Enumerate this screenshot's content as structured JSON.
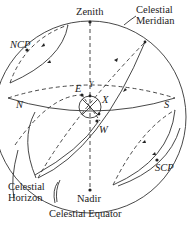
{
  "labels": {
    "zenith": "Zenith",
    "nadir": "Nadir",
    "celestial_meridian_1": "Celestial",
    "celestial_meridian_2": "Meridian",
    "ncp": "NCP",
    "scp": "SCP",
    "north": "N",
    "south": "S",
    "east": "E",
    "west": "W",
    "observer_x": "X",
    "observer_y": "Y",
    "celestial_horizon_1": "Celestial",
    "celestial_horizon_2": "Horizon",
    "celestial_equator": "Celestial Equator"
  },
  "colors": {
    "line": "#333333",
    "background": "#ffffff"
  }
}
